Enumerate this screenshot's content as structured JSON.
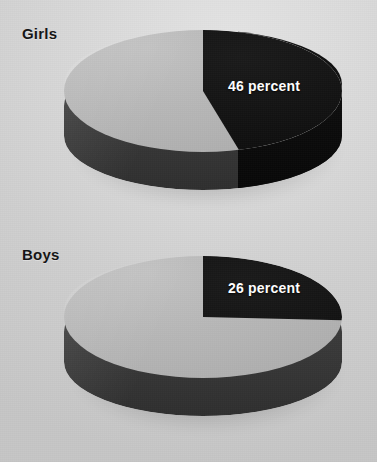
{
  "figure": {
    "background_color": "#d4d4d4",
    "slice_colors": {
      "highlight": "#0d0d0d",
      "remainder": "#b3b3b3",
      "side_wall": "#3a3a3a",
      "side_wall_highlight": "#0c0c0c"
    }
  },
  "chart_data": [
    {
      "type": "pie",
      "title": "Girls",
      "categories": [
        "46 percent",
        "Remainder"
      ],
      "values": [
        46,
        54
      ],
      "labels": [
        "46 percent",
        ""
      ],
      "units": "percent",
      "start_angle_deg": 0,
      "direction": "clockwise",
      "three_d": true,
      "legend": "none",
      "colors": [
        "#0d0d0d",
        "#b3b3b3"
      ]
    },
    {
      "type": "pie",
      "title": "Boys",
      "categories": [
        "26 percent",
        "Remainder"
      ],
      "values": [
        26,
        74
      ],
      "labels": [
        "26 percent",
        ""
      ],
      "units": "percent",
      "start_angle_deg": 0,
      "direction": "clockwise",
      "three_d": true,
      "legend": "none",
      "colors": [
        "#0d0d0d",
        "#b3b3b3"
      ]
    }
  ],
  "charts": {
    "girls": {
      "label": "Girls",
      "percent_label": "46 percent"
    },
    "boys": {
      "label": "Boys",
      "percent_label": "26 percent"
    }
  }
}
